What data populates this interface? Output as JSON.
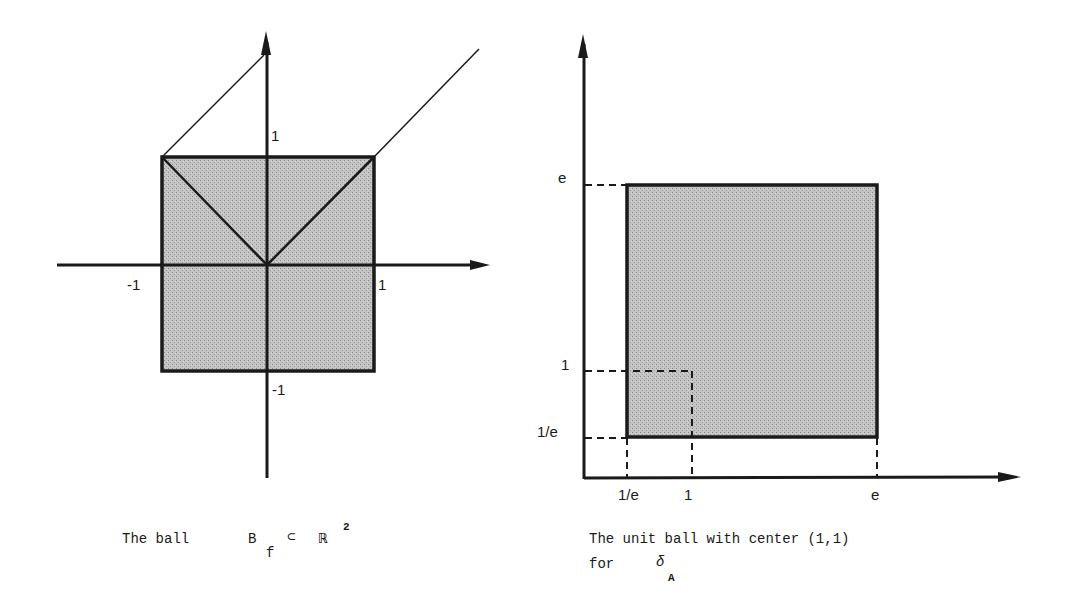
{
  "left_figure": {
    "axis_labels": {
      "y_pos": "1",
      "x_neg": "-1",
      "x_pos": "1",
      "y_neg": "-1"
    },
    "caption": {
      "prefix": "The ball",
      "symbol": "B",
      "subscript": "f",
      "relation": "⊂",
      "space": "ℝ",
      "superscript": "2"
    }
  },
  "right_figure": {
    "y_tick_labels": [
      "e",
      "1",
      "1/e"
    ],
    "x_tick_labels": [
      "1/e",
      "1",
      "e"
    ],
    "caption": {
      "line1": "The unit ball with center (1,1)",
      "line2_prefix": "for",
      "symbol": "δ",
      "subscript": "A"
    }
  },
  "colors": {
    "ink": "#1a1a1a",
    "fill": "#b8b8b8",
    "background": "#ffffff"
  }
}
